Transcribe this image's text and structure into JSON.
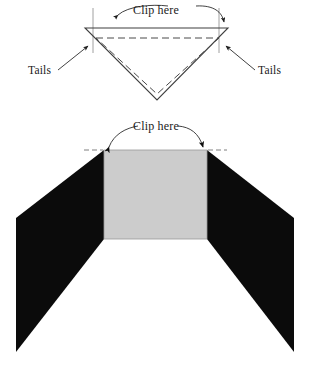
{
  "figure": {
    "background_color": "#ffffff",
    "width": 309,
    "height": 367,
    "colors": {
      "wing_black": "#0b0b0b",
      "panel_gray": "#cccccc",
      "panel_outline": "#9a9a9a",
      "line_gray": "#3f3f3f",
      "guide_gray": "#888888",
      "text": "#1a1a1a"
    }
  },
  "top_diagram": {
    "name": "inverted-triangle-view",
    "labels": {
      "clip_here": "Clip here",
      "tails_left": "Tails",
      "tails_right": "Tails"
    },
    "geometry": {
      "triangle_points": "85,28 228,28 157,100",
      "inner_dashed_points": "96,38 219,38 157,94",
      "guide_left_x": 93,
      "guide_right_x": 219,
      "guide_top_y": 8,
      "guide_bottom_y": 53,
      "top_edge_y": 28
    }
  },
  "bottom_diagram": {
    "name": "unfolded-panels-view",
    "labels": {
      "clip_here": "Clip here"
    },
    "geometry": {
      "panel_x0": 104,
      "panel_x1": 207,
      "panel_y0": 150,
      "panel_y1": 239,
      "left_wing_points": "104,150 104,239 16,352 16,218",
      "right_wing_points": "207,150 207,239 294,352 294,218",
      "dash_guide_left": "84,150 103,150",
      "dash_guide_right": "208,150 227,150"
    }
  }
}
